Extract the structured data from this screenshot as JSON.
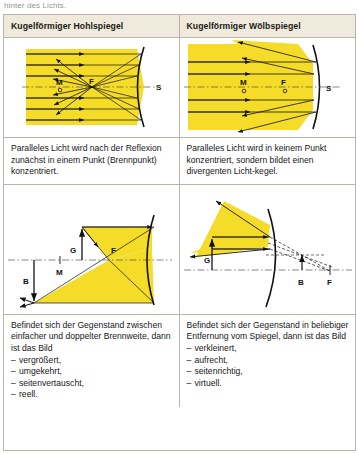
{
  "page": {
    "cut_off_top_text": "hinter des Lichts."
  },
  "colors": {
    "beam_yellow": "#F5DC28",
    "beam_yellow_edge": "#E3C400",
    "header_bg": "#EFEADB",
    "border": "#B9B5A8",
    "ray_black": "#111111",
    "axis_gray": "#555555"
  },
  "table": {
    "header": {
      "left": "Kugelförmiger Hohlspiegel",
      "right": "Kugelförmiger Wölbspiegel"
    },
    "diagram_top": {
      "left": {
        "name": "concave-mirror-parallel-rays-diagram",
        "labels": [
          "M",
          "F",
          "S"
        ],
        "mirror_type": "concave",
        "description": "Parallel rays reflect through the focal point F"
      },
      "right": {
        "name": "convex-mirror-parallel-rays-diagram",
        "labels": [
          "M",
          "F",
          "S"
        ],
        "mirror_type": "convex",
        "description": "Parallel rays diverge after reflection, virtual focus F"
      }
    },
    "text_top": {
      "left": "Paralleles Licht wird nach der Reflexion zunächst in einem Punkt (Brennpunkt) konzentriert.",
      "right": "Paralleles Licht wird in keinem Punkt konzentriert, sondern bildet einen divergenten Licht-kegel."
    },
    "diagram_bottom": {
      "left": {
        "name": "concave-mirror-image-construction-diagram",
        "labels": [
          "G",
          "F",
          "M",
          "B"
        ],
        "mirror_type": "concave",
        "object_label": "G",
        "image_label": "B"
      },
      "right": {
        "name": "convex-mirror-image-construction-diagram",
        "labels": [
          "G",
          "B",
          "F"
        ],
        "mirror_type": "convex",
        "object_label": "G",
        "image_label": "B"
      }
    },
    "text_bottom": {
      "left": {
        "intro": "Befindet sich der Gegenstand zwischen einfacher und doppelter Brennweite, dann ist das Bild",
        "items": [
          "vergrößert,",
          "umgekehrt,",
          "seitenvertauscht,",
          "reell."
        ],
        "bullet": "–"
      },
      "right": {
        "intro": "Befindet sich der Gegenstand in beliebiger Entfernung vom Spiegel, dann ist das Bild",
        "items": [
          "verkleinert,",
          "aufrecht,",
          "seitenrichtig,",
          "virtuell."
        ],
        "bullet": "–"
      }
    }
  }
}
